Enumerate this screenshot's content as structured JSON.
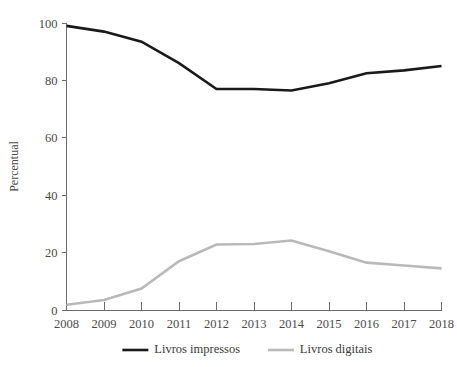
{
  "chart_data": {
    "type": "line",
    "title": "",
    "subtitle": "",
    "xlabel": "",
    "ylabel": "Percentual",
    "x": [
      2008,
      2009,
      2010,
      2011,
      2012,
      2013,
      2014,
      2015,
      2016,
      2017,
      2018
    ],
    "categories": [
      "2008",
      "2009",
      "2010",
      "2011",
      "2012",
      "2013",
      "2014",
      "2015",
      "2016",
      "2017",
      "2018"
    ],
    "xlim": [
      2008,
      2018
    ],
    "ylim": [
      0,
      100
    ],
    "yticks": [
      0,
      20,
      40,
      60,
      80,
      100
    ],
    "ytick_labels": [
      "0",
      "20",
      "40",
      "60",
      "80",
      "100"
    ],
    "xticks": [
      2008,
      2009,
      2010,
      2011,
      2012,
      2013,
      2014,
      2015,
      2016,
      2017,
      2018
    ],
    "xtick_labels": [
      "2008",
      "2009",
      "2010",
      "2011",
      "2012",
      "2013",
      "2014",
      "2015",
      "2016",
      "2017",
      "2018"
    ],
    "grid": false,
    "legend_position": "bottom",
    "series": [
      {
        "name": "Livros impressos",
        "color": "#1a1a1a",
        "width": 2.6,
        "values": [
          99,
          97,
          93.5,
          86,
          77,
          77,
          76.5,
          79,
          82.5,
          83.5,
          85
        ]
      },
      {
        "name": "Livros digitais",
        "color": "#b9b9b9",
        "width": 2.6,
        "values": [
          1.8,
          3.5,
          7.5,
          17,
          22.8,
          23,
          24.2,
          20.5,
          16.5,
          15.5,
          14.5
        ]
      }
    ]
  },
  "legend": {
    "items": [
      {
        "label": "Livros impressos",
        "color": "#1a1a1a"
      },
      {
        "label": "Livros digitais",
        "color": "#b9b9b9"
      }
    ]
  },
  "axes": {
    "y_title": "Percentual"
  }
}
